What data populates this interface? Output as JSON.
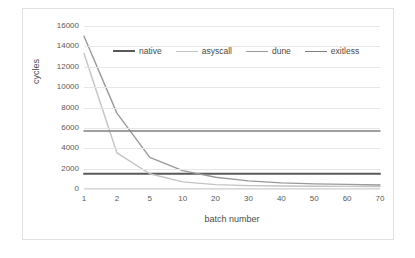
{
  "chart_data": {
    "type": "line",
    "title": "",
    "xlabel": "batch number",
    "ylabel": "cycles",
    "x_is_categorical": true,
    "categories": [
      "1",
      "2",
      "5",
      "10",
      "20",
      "30",
      "40",
      "50",
      "60",
      "70"
    ],
    "xticklabels": [
      "1",
      "2",
      "5",
      "10",
      "20",
      "30",
      "40",
      "50",
      "60",
      "70"
    ],
    "yticklabels": [
      "0",
      "2000",
      "4000",
      "6000",
      "8000",
      "10000",
      "12000",
      "14000",
      "16000"
    ],
    "ylim": [
      0,
      16000
    ],
    "ytick_step": 2000,
    "grid": "horizontal",
    "legend_position": "top-center-inside",
    "series": [
      {
        "name": "native",
        "color": "#595959",
        "width": 2.0,
        "values": [
          1500,
          1500,
          1500,
          1500,
          1500,
          1500,
          1500,
          1500,
          1500,
          1500
        ]
      },
      {
        "name": "asyscall",
        "color": "#c3c3c3",
        "width": 1.4,
        "values": [
          13300,
          3550,
          1500,
          700,
          430,
          330,
          290,
          270,
          260,
          250
        ]
      },
      {
        "name": "dune",
        "color": "#9a9a9a",
        "width": 1.4,
        "values": [
          15000,
          7450,
          3100,
          1800,
          1150,
          800,
          600,
          500,
          450,
          400
        ]
      },
      {
        "name": "exitless",
        "color": "#808080",
        "width": 1.4,
        "values": [
          5700,
          5700,
          5700,
          5700,
          5700,
          5700,
          5700,
          5700,
          5700,
          5700
        ]
      }
    ]
  }
}
